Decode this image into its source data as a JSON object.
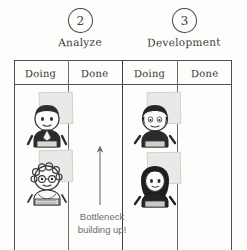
{
  "board": {
    "type": "kanban-bottleneck-sketch",
    "ink_color": "#4a4a4a",
    "background_color": "#fdfdfb",
    "sticky_color": "#e9e9e7"
  },
  "steps": [
    {
      "number": "2",
      "label": "Analyze"
    },
    {
      "number": "3",
      "label": "Development"
    }
  ],
  "columns": [
    {
      "header": "Doing",
      "phase": "Analyze",
      "card_count": 2
    },
    {
      "header": "Done",
      "phase": "Analyze",
      "card_count": 0
    },
    {
      "header": "Doing",
      "phase": "Development",
      "card_count": 2
    },
    {
      "header": "Done",
      "phase": "Development",
      "card_count": 0
    }
  ],
  "cards": [
    {
      "column": "analyze-doing",
      "avatar": "person-short-dark-hair",
      "note": "sticky-note"
    },
    {
      "column": "analyze-doing",
      "avatar": "person-curly-hair-glasses",
      "note": "sticky-note"
    },
    {
      "column": "development-doing",
      "avatar": "person-bowl-cut-hair",
      "note": "sticky-note"
    },
    {
      "column": "development-doing",
      "avatar": "person-long-dark-hair",
      "note": "sticky-note"
    }
  ],
  "annotation": {
    "arrow_direction": "up",
    "line1": "Bottleneck",
    "line2": "building up!",
    "text_color": "#6d6d6d"
  }
}
